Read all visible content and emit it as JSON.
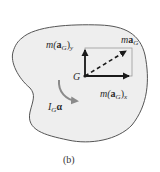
{
  "figure": {
    "caption": "(b)",
    "body_fill": "#eeeeee",
    "outline_color": "#555555",
    "arrow_color": "#1a1a1a",
    "moment_arrow_color": "#8a8a8a",
    "rect_color": "#999999"
  },
  "labels": {
    "may_m": "m(",
    "may_a": "a",
    "may_sub_G": "G",
    "may_close": ")",
    "may_sub_y": "y",
    "mag_m": "m",
    "mag_a": "a",
    "mag_sub_G": "G",
    "G": "G",
    "max_m": "m(",
    "max_a": "a",
    "max_sub_G": "G",
    "max_close": ")",
    "max_sub_x": "x",
    "ig_I": "I",
    "ig_sub_G": "G",
    "ig_alpha": "α"
  }
}
